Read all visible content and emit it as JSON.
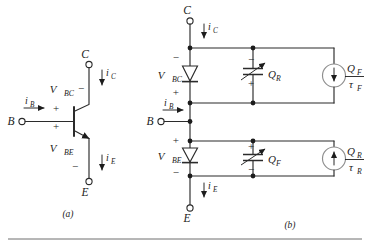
{
  "figure": {
    "background_color": "#ffffff",
    "ink_color": "#1c1c1c",
    "source_color": "#8e8e8e",
    "captions": {
      "left": "(a)",
      "right": "(b)"
    }
  },
  "circuit_a": {
    "name": "npn-transistor-symbol",
    "terminals": [
      {
        "id": "collector",
        "label": "C",
        "position": "top"
      },
      {
        "id": "base",
        "label": "B",
        "position": "left"
      },
      {
        "id": "emitter",
        "label": "E",
        "position": "bottom"
      }
    ],
    "currents": [
      {
        "id": "i-base",
        "symbol": "i",
        "subscript": "B",
        "direction": "right"
      },
      {
        "id": "i-collector",
        "symbol": "i",
        "subscript": "C",
        "direction": "down"
      },
      {
        "id": "i-emitter",
        "symbol": "i",
        "subscript": "E",
        "direction": "down"
      }
    ],
    "voltages": [
      {
        "id": "v-bc",
        "symbol": "V",
        "subscript": "BC",
        "plus_sign": "+",
        "minus_sign": "−",
        "plus_at": "base-side",
        "minus_at": "collector-side"
      },
      {
        "id": "v-be",
        "symbol": "V",
        "subscript": "BE",
        "plus_sign": "+",
        "minus_sign": "−",
        "plus_at": "base-side",
        "minus_at": "emitter-side"
      }
    ]
  },
  "circuit_b": {
    "name": "charge-control-equivalent-circuit",
    "terminals": [
      {
        "id": "collector",
        "label": "C",
        "position": "top"
      },
      {
        "id": "base",
        "label": "B",
        "position": "left"
      },
      {
        "id": "emitter",
        "label": "E",
        "position": "bottom"
      }
    ],
    "currents": [
      {
        "id": "i-base",
        "symbol": "i",
        "subscript": "B",
        "direction": "right"
      },
      {
        "id": "i-collector",
        "symbol": "i",
        "subscript": "C",
        "direction": "down"
      },
      {
        "id": "i-emitter",
        "symbol": "i",
        "subscript": "E",
        "direction": "down"
      }
    ],
    "upper_branch": {
      "id": "base-collector-branch",
      "diode": {
        "id": "diode-bc",
        "orientation": "cathode-down",
        "voltage_symbol": "V",
        "voltage_subscript": "BC",
        "minus_sign": "−",
        "plus_sign": "+",
        "minus_at": "top",
        "plus_at": "bottom"
      },
      "capacitor": {
        "id": "capacitor-qr",
        "type": "nonlinear-variable",
        "charge_symbol": "Q",
        "charge_subscript": "R",
        "minus_sign": "−",
        "plus_sign": "+",
        "minus_at": "top",
        "plus_at": "bottom"
      },
      "current_source": {
        "id": "source-qf-tauf",
        "numerator_symbol": "Q",
        "numerator_subscript": "F",
        "denominator_symbol": "τ",
        "denominator_subscript": "F",
        "arrow_direction": "down"
      }
    },
    "lower_branch": {
      "id": "base-emitter-branch",
      "diode": {
        "id": "diode-be",
        "orientation": "cathode-down",
        "voltage_symbol": "V",
        "voltage_subscript": "BE",
        "plus_sign": "+",
        "minus_sign": "−",
        "plus_at": "top",
        "minus_at": "bottom"
      },
      "capacitor": {
        "id": "capacitor-qf",
        "type": "nonlinear-variable",
        "charge_symbol": "Q",
        "charge_subscript": "F",
        "plus_sign": "+",
        "minus_sign": "−",
        "plus_at": "top",
        "minus_at": "bottom"
      },
      "current_source": {
        "id": "source-qr-taur",
        "numerator_symbol": "Q",
        "numerator_subscript": "R",
        "denominator_symbol": "τ",
        "denominator_subscript": "R",
        "arrow_direction": "up"
      }
    }
  }
}
